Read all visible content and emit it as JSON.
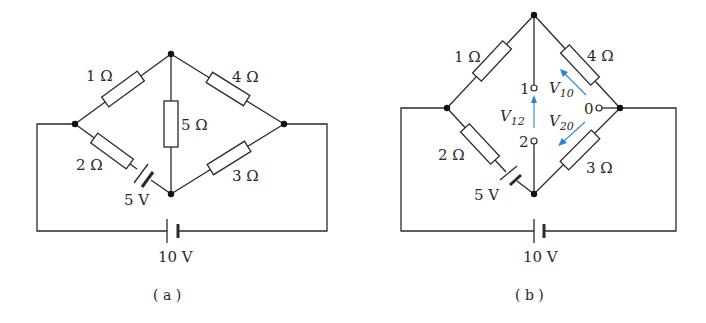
{
  "panel_a": {
    "caption": "( a )",
    "r1": "1 Ω",
    "r2": "2 Ω",
    "r3": "3 Ω",
    "r4": "4 Ω",
    "r5": "5 Ω",
    "e1": "5 V",
    "e2": "10 V"
  },
  "panel_b": {
    "caption": "( b )",
    "r1": "1 Ω",
    "r2": "2 Ω",
    "r3": "3 Ω",
    "r4": "4 Ω",
    "e1": "5 V",
    "e2": "10 V",
    "t1": "1",
    "t2": "2",
    "t0": "0",
    "v12": "V",
    "v12_sub": "12",
    "v10": "V",
    "v10_sub": "10",
    "v20": "V",
    "v20_sub": "20",
    "arrow_color": "#2a84d2"
  }
}
